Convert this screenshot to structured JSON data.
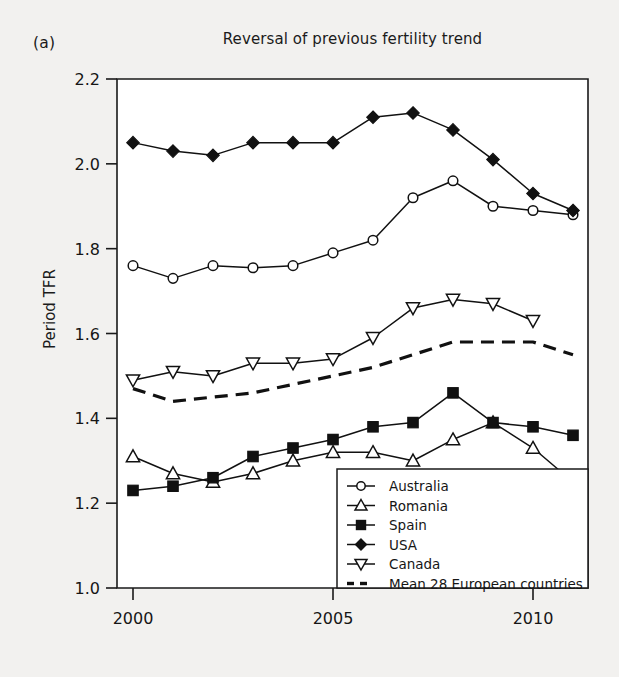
{
  "figure": {
    "panel_label": "(a)",
    "title": "Reversal of previous fertility trend"
  },
  "chart_data": {
    "type": "line",
    "title": "Reversal of previous fertility trend",
    "xlabel": "",
    "ylabel": "Period TFR",
    "xlim": [
      1999.5,
      2011.8
    ],
    "ylim": [
      1.0,
      2.2
    ],
    "xticks": [
      2000,
      2005,
      2010
    ],
    "xtick_labels": [
      "2000",
      "2005",
      "2010"
    ],
    "yticks": [
      1.0,
      1.2,
      1.4,
      1.6,
      1.8,
      2.0,
      2.2
    ],
    "ytick_labels": [
      "1.0",
      "1.2",
      "1.4",
      "1.6",
      "1.8",
      "2.0",
      "2.2"
    ],
    "grid": false,
    "legend_position": "bottom-right",
    "x": [
      2000,
      2001,
      2002,
      2003,
      2004,
      2005,
      2006,
      2007,
      2008,
      2009,
      2010,
      2011
    ],
    "series": [
      {
        "name": "Australia",
        "marker": "open-circle",
        "linestyle": "solid",
        "x": [
          2000,
          2001,
          2002,
          2003,
          2004,
          2005,
          2006,
          2007,
          2008,
          2009,
          2010,
          2011
        ],
        "values": [
          1.76,
          1.73,
          1.76,
          1.755,
          1.76,
          1.79,
          1.82,
          1.92,
          1.96,
          1.9,
          1.89,
          1.88
        ]
      },
      {
        "name": "Romania",
        "marker": "open-triangle-up",
        "linestyle": "solid",
        "x": [
          2000,
          2001,
          2002,
          2003,
          2004,
          2005,
          2006,
          2007,
          2008,
          2009,
          2010,
          2011
        ],
        "values": [
          1.31,
          1.27,
          1.25,
          1.27,
          1.3,
          1.32,
          1.32,
          1.3,
          1.35,
          1.39,
          1.33,
          1.25
        ]
      },
      {
        "name": "Spain",
        "marker": "filled-square",
        "linestyle": "solid",
        "x": [
          2000,
          2001,
          2002,
          2003,
          2004,
          2005,
          2006,
          2007,
          2008,
          2009,
          2010,
          2011
        ],
        "values": [
          1.23,
          1.24,
          1.26,
          1.31,
          1.33,
          1.35,
          1.38,
          1.39,
          1.46,
          1.39,
          1.38,
          1.36
        ]
      },
      {
        "name": "USA",
        "marker": "filled-diamond",
        "linestyle": "solid",
        "x": [
          2000,
          2001,
          2002,
          2003,
          2004,
          2005,
          2006,
          2007,
          2008,
          2009,
          2010,
          2011
        ],
        "values": [
          2.05,
          2.03,
          2.02,
          2.05,
          2.05,
          2.05,
          2.11,
          2.12,
          2.08,
          2.01,
          1.93,
          1.89
        ]
      },
      {
        "name": "Canada",
        "marker": "open-triangle-down",
        "linestyle": "solid",
        "x": [
          2000,
          2001,
          2002,
          2003,
          2004,
          2005,
          2006,
          2007,
          2008,
          2009,
          2010
        ],
        "values": [
          1.49,
          1.51,
          1.5,
          1.53,
          1.53,
          1.54,
          1.59,
          1.66,
          1.68,
          1.67,
          1.63
        ]
      },
      {
        "name": "Mean 28  European countries",
        "marker": "none",
        "linestyle": "dashed",
        "x": [
          2000,
          2001,
          2002,
          2003,
          2004,
          2005,
          2006,
          2007,
          2008,
          2009,
          2010,
          2011
        ],
        "values": [
          1.47,
          1.44,
          1.45,
          1.46,
          1.48,
          1.5,
          1.52,
          1.55,
          1.58,
          1.58,
          1.58,
          1.55
        ]
      }
    ]
  },
  "legend": {
    "entries": [
      {
        "label": "Australia",
        "marker": "open-circle"
      },
      {
        "label": "Romania",
        "marker": "open-triangle-up"
      },
      {
        "label": "Spain",
        "marker": "filled-square"
      },
      {
        "label": "USA",
        "marker": "filled-diamond"
      },
      {
        "label": "Canada",
        "marker": "open-triangle-down"
      },
      {
        "label": "Mean 28  European countries",
        "marker": "dashed-line"
      }
    ]
  },
  "colors": {
    "ink": "#111111",
    "page": "#f2f1ef",
    "plot_bg": "#ffffff"
  }
}
